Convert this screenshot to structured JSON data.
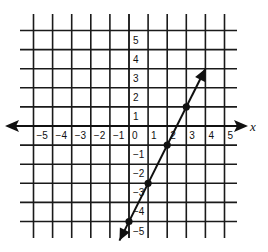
{
  "chart_data": {
    "type": "line",
    "title": "",
    "xlabel": "x",
    "ylabel": "",
    "xlim": [
      -5,
      5
    ],
    "ylim": [
      -5,
      5
    ],
    "grid": true,
    "x_ticks": [
      -5,
      -4,
      -3,
      -2,
      -1,
      0,
      1,
      2,
      3,
      4,
      5
    ],
    "x_tick_labels": [
      "−5",
      "−4",
      "−3",
      "−2",
      "−1",
      "0",
      "1",
      "2",
      "3",
      "4",
      "5"
    ],
    "y_ticks": [
      5,
      4,
      3,
      2,
      1,
      -1,
      -2,
      -3,
      -4,
      -5
    ],
    "y_tick_labels": [
      "5",
      "4",
      "3",
      "2",
      "1",
      "−1",
      "−2",
      "−3",
      "−4",
      "−5"
    ],
    "series": [
      {
        "name": "line",
        "equation": "y = 2x - 5",
        "arrows_both_ends": true,
        "endpoints": [
          [
            -0.5,
            -6
          ],
          [
            4,
            3
          ]
        ],
        "points": [
          {
            "x": 0,
            "y": -5
          },
          {
            "x": 1,
            "y": -3
          },
          {
            "x": 2,
            "y": -1
          },
          {
            "x": 3,
            "y": 1
          }
        ]
      }
    ],
    "colors": {
      "line": "#111111",
      "grid": "#1a1a1a",
      "background": "#ffffff"
    }
  }
}
